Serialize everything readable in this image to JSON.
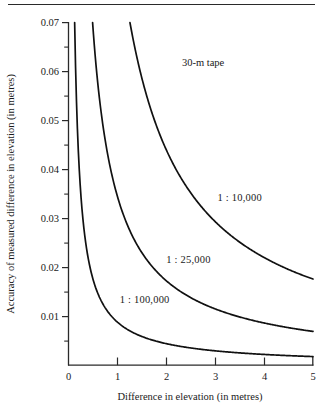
{
  "chart_data": {
    "type": "line",
    "title": "",
    "subtitle": "",
    "annotation": "30-m tape",
    "xlabel": "Difference in elevation (in metres)",
    "ylabel": "Accuracy of measured difference in elevation (in metres)",
    "xlim": [
      0,
      5
    ],
    "ylim": [
      0,
      0.07
    ],
    "grid": false,
    "legend_position": "inline-labels",
    "xticks": [
      0,
      1,
      2,
      3,
      4,
      5
    ],
    "xtick_labels": [
      "0",
      "1",
      "2",
      "3",
      "4",
      "5"
    ],
    "yticks": [
      0.01,
      0.02,
      0.03,
      0.04,
      0.05,
      0.06,
      0.07
    ],
    "ytick_labels": [
      "0.01",
      "0.02",
      "0.03",
      "0.04",
      "0.05",
      "0.06",
      "0.07"
    ],
    "yminor_ticks": [
      0.005,
      0.015,
      0.025,
      0.035,
      0.045,
      0.055,
      0.065
    ],
    "series": [
      {
        "name": "1:10,000",
        "label": "1:10,000",
        "constant": 0.088,
        "color": "#111111",
        "label_x": 3.05,
        "label_y": 0.0335,
        "x": [
          1.26,
          1.4,
          1.6,
          1.8,
          2.0,
          2.25,
          2.5,
          2.75,
          3.0,
          3.25,
          3.5,
          3.75,
          4.0,
          4.25,
          4.5,
          4.75,
          5.0
        ],
        "y": [
          0.07,
          0.0629,
          0.055,
          0.0489,
          0.044,
          0.0391,
          0.0352,
          0.032,
          0.0293,
          0.0271,
          0.0251,
          0.0235,
          0.022,
          0.0207,
          0.0196,
          0.0185,
          0.0176
        ]
      },
      {
        "name": "1:25,000",
        "label": "1 : 25,000",
        "constant": 0.0345,
        "color": "#111111",
        "label_x": 2.0,
        "label_y": 0.0208,
        "x": [
          0.493,
          0.6,
          0.7,
          0.85,
          1.0,
          1.25,
          1.5,
          1.75,
          2.0,
          2.25,
          2.5,
          2.75,
          3.0,
          3.5,
          4.0,
          4.5,
          5.0
        ],
        "y": [
          0.07,
          0.0575,
          0.0493,
          0.0406,
          0.0345,
          0.0276,
          0.023,
          0.0197,
          0.0173,
          0.0153,
          0.0138,
          0.0125,
          0.0115,
          0.0099,
          0.0086,
          0.0077,
          0.0069
        ]
      },
      {
        "name": "1:100,000",
        "label": "1 : 100,000",
        "constant": 0.0088,
        "color": "#111111",
        "label_x": 1.05,
        "label_y": 0.0128,
        "x": [
          0.126,
          0.15,
          0.2,
          0.25,
          0.3,
          0.4,
          0.5,
          0.65,
          0.8,
          1.0,
          1.25,
          1.5,
          1.75,
          2.0,
          2.5,
          3.0,
          3.5,
          4.0,
          4.5,
          5.0
        ],
        "y": [
          0.07,
          0.0587,
          0.044,
          0.0352,
          0.0293,
          0.022,
          0.0176,
          0.0135,
          0.011,
          0.0088,
          0.007,
          0.0059,
          0.005,
          0.0044,
          0.0035,
          0.0029,
          0.0025,
          0.0022,
          0.002,
          0.0018
        ]
      }
    ]
  },
  "axes": {
    "x_title": "Difference in elevation (in metres)",
    "y_title": "Accuracy of measured difference in elevation (in metres)"
  },
  "labels": {
    "tape": "30-m tape",
    "curve_10k": "1 : 10,000",
    "curve_25k": "1 : 25,000",
    "curve_100k": "1 : 100,000",
    "x0": "0",
    "x1": "1",
    "x2": "2",
    "x3": "3",
    "x4": "4",
    "x5": "5",
    "y01": "0.01",
    "y02": "0.02",
    "y03": "0.03",
    "y04": "0.04",
    "y05": "0.05",
    "y06": "0.06",
    "y07": "0.07"
  },
  "colors": {
    "curve": "#111111",
    "axis": "#2a2a2a",
    "text": "#1a1a1a",
    "background": "#ffffff"
  }
}
